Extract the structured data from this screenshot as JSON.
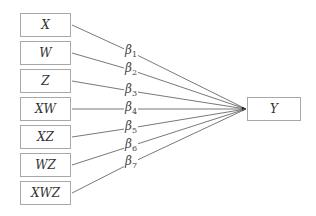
{
  "diagram": {
    "inputs": [
      {
        "label": "X",
        "coef": "β",
        "sub": "1"
      },
      {
        "label": "W",
        "coef": "β",
        "sub": "2"
      },
      {
        "label": "Z",
        "coef": "β",
        "sub": "3"
      },
      {
        "label": "XW",
        "coef": "β",
        "sub": "4"
      },
      {
        "label": "XZ",
        "coef": "β",
        "sub": "5"
      },
      {
        "label": "WZ",
        "coef": "β",
        "sub": "6"
      },
      {
        "label": "XWZ",
        "coef": "β",
        "sub": "7"
      }
    ],
    "output": {
      "label": "Y"
    },
    "colors": {
      "line": "#555555",
      "border": "#a8a8a8",
      "text": "#333333"
    }
  }
}
